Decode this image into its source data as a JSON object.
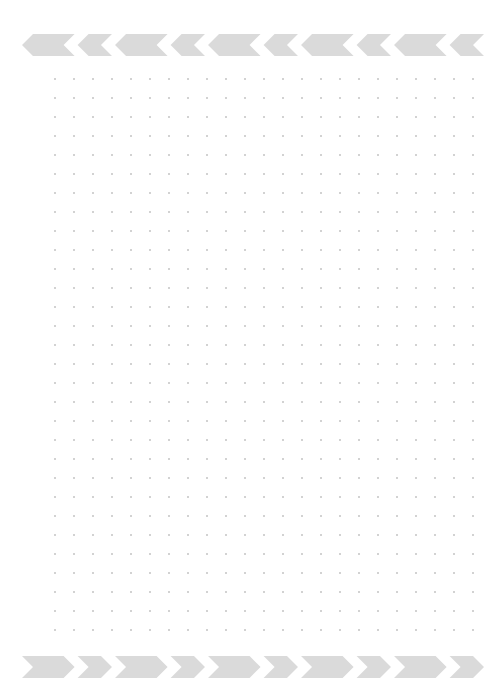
{
  "page": {
    "type": "dot-grid-paper",
    "background_color": "#ffffff",
    "dot_color": "#9a9a9a",
    "chevron_color": "#dadada"
  },
  "top_banner": {
    "direction": "left",
    "chevrons": [
      {
        "kind": "long",
        "width": 52
      },
      {
        "kind": "short",
        "width": 34
      },
      {
        "kind": "long",
        "width": 52
      },
      {
        "kind": "short",
        "width": 34
      },
      {
        "kind": "long",
        "width": 52
      },
      {
        "kind": "short",
        "width": 34
      },
      {
        "kind": "long",
        "width": 52
      },
      {
        "kind": "short",
        "width": 34
      },
      {
        "kind": "long",
        "width": 52
      },
      {
        "kind": "short",
        "width": 34
      }
    ]
  },
  "bottom_banner": {
    "direction": "right",
    "chevrons": [
      {
        "kind": "long",
        "width": 52
      },
      {
        "kind": "short",
        "width": 34
      },
      {
        "kind": "long",
        "width": 52
      },
      {
        "kind": "short",
        "width": 34
      },
      {
        "kind": "long",
        "width": 52
      },
      {
        "kind": "short",
        "width": 34
      },
      {
        "kind": "long",
        "width": 52
      },
      {
        "kind": "short",
        "width": 34
      },
      {
        "kind": "long",
        "width": 52
      },
      {
        "kind": "short",
        "width": 34
      }
    ]
  },
  "grid": {
    "origin_x": 55,
    "origin_y": 79,
    "spacing": 19,
    "columns": 23,
    "rows": 30,
    "dot_radius": 0.8
  }
}
